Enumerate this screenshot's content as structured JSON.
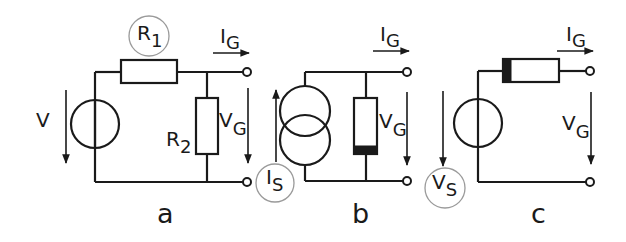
{
  "colors": {
    "line": "#1a1a1a",
    "highlight_circle": "#9a9a9a",
    "background": "#ffffff",
    "band": "#1a1a1a"
  },
  "diagram": {
    "circuits": [
      {
        "caption": "a",
        "description": "Voltage source V with series resistor R1 and shunt resistor R2",
        "labels": {
          "source_voltage": "V",
          "r1": {
            "main": "R",
            "sub": "1",
            "highlighted": true
          },
          "r2": {
            "main": "R",
            "sub": "2"
          },
          "output_current": {
            "main": "I",
            "sub": "G"
          },
          "output_voltage": {
            "main": "V",
            "sub": "G"
          }
        }
      },
      {
        "caption": "b",
        "description": "Current source IS with parallel resistor (banded)",
        "labels": {
          "source_current": {
            "main": "I",
            "sub": "S",
            "highlighted": true
          },
          "output_current": {
            "main": "I",
            "sub": "G"
          },
          "output_voltage": {
            "main": "V",
            "sub": "G"
          }
        }
      },
      {
        "caption": "c",
        "description": "Voltage source VS with series resistor (banded)",
        "labels": {
          "source_voltage": {
            "main": "V",
            "sub": "S",
            "highlighted": true
          },
          "output_current": {
            "main": "I",
            "sub": "G"
          },
          "output_voltage": {
            "main": "V",
            "sub": "G"
          }
        }
      }
    ]
  }
}
